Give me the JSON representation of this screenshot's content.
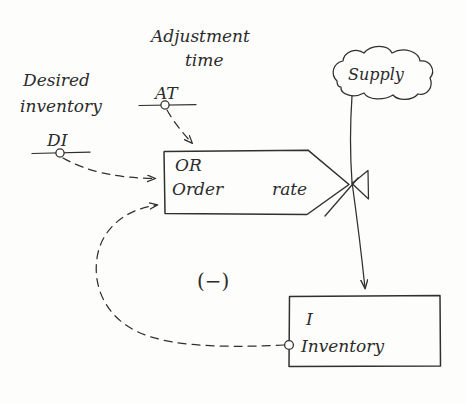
{
  "diagram": {
    "style": "hand-drawn pencil sketch",
    "background_color": "#fdfdfc",
    "ink_color": "#30302e"
  },
  "labels": {
    "adjustment_time_caption_line1": "Adjustment",
    "adjustment_time_caption_line2": "time",
    "adjustment_time_abbrev": "AT",
    "desired_inventory_caption_line1": "Desired",
    "desired_inventory_caption_line2": "inventory",
    "desired_inventory_abbrev": "DI",
    "order_rate_abbrev": "OR",
    "order_rate_word_order": "Order",
    "order_rate_word_rate": "rate",
    "supply_cloud": "Supply",
    "inventory_abbrev": "I",
    "inventory_name": "Inventory",
    "loop_polarity": "(−)"
  },
  "nodes": [
    {
      "id": "adjustment-time",
      "kind": "auxiliary-variable",
      "abbrev": "AT",
      "caption": "Adjustment time"
    },
    {
      "id": "desired-inventory",
      "kind": "auxiliary-variable",
      "abbrev": "DI",
      "caption": "Desired inventory"
    },
    {
      "id": "order-rate",
      "kind": "rate-flow-box",
      "abbrev": "OR",
      "caption": "Order rate"
    },
    {
      "id": "supply",
      "kind": "source-cloud",
      "caption": "Supply"
    },
    {
      "id": "inventory",
      "kind": "stock-level-box",
      "abbrev": "I",
      "caption": "Inventory"
    },
    {
      "id": "valve",
      "kind": "flow-valve",
      "caption": ""
    }
  ],
  "links": [
    {
      "id": "at-to-order-rate",
      "from": "adjustment-time",
      "to": "order-rate",
      "style": "dashed",
      "arrow": true
    },
    {
      "id": "di-to-order-rate",
      "from": "desired-inventory",
      "to": "order-rate",
      "style": "dashed",
      "arrow": true
    },
    {
      "id": "inventory-to-order-rate",
      "from": "inventory",
      "to": "order-rate",
      "style": "dashed",
      "arrow": true,
      "polarity": "(−)"
    },
    {
      "id": "supply-to-inventory",
      "from": "supply",
      "to": "inventory",
      "style": "solid",
      "arrow": true
    }
  ]
}
